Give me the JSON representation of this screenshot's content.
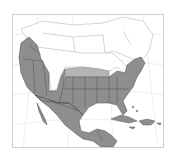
{
  "map": {
    "type": "range-map",
    "region": "North America",
    "legend": [],
    "colors": {
      "range_fill": "#8e8e8e",
      "range_light": "#b4b4b4",
      "border": "#5a5a5a",
      "land_outline": "#b8b8b8",
      "graticule": "#e2e2e2",
      "background": "#ffffff"
    },
    "shaded_regions": [
      "Western United States",
      "Southern and Central United States",
      "Eastern United States",
      "Mexico",
      "Central America",
      "Greater Antilles (Cuba, Hispaniola)"
    ]
  }
}
